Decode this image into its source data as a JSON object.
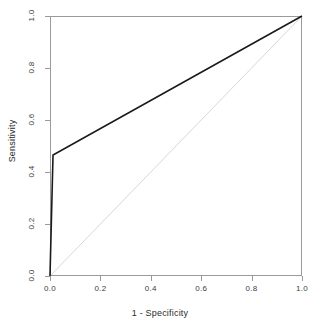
{
  "chart_data": {
    "type": "line",
    "title": "",
    "xlabel": "1 - Specificity",
    "ylabel": "Sensitivity",
    "xlim": [
      0,
      1
    ],
    "ylim": [
      0,
      1
    ],
    "grid": false,
    "legend": "none",
    "xticks": [
      "0.0",
      "0.2",
      "0.4",
      "0.6",
      "0.8",
      "1.0"
    ],
    "xtick_values": [
      0.0,
      0.2,
      0.4,
      0.6,
      0.8,
      1.0
    ],
    "yticks": [
      "0.0",
      "0.2",
      "0.4",
      "0.6",
      "0.8",
      "1.0"
    ],
    "ytick_values": [
      0.0,
      0.2,
      0.4,
      0.6,
      0.8,
      1.0
    ],
    "series": [
      {
        "name": "ROC curve",
        "color": "#1a1a1a",
        "width": 1.6,
        "points": [
          [
            0.0,
            0.0
          ],
          [
            0.012,
            0.465
          ],
          [
            1.0,
            1.0
          ]
        ]
      },
      {
        "name": "Chance diagonal",
        "color": "#d8d8d8",
        "width": 1.0,
        "points": [
          [
            0.0,
            0.0
          ],
          [
            1.0,
            1.0
          ]
        ]
      }
    ]
  },
  "axes": {
    "frame_color": "#9a9a9a",
    "tick_color": "#9a9a9a",
    "text_color": "#3d3d3d"
  }
}
